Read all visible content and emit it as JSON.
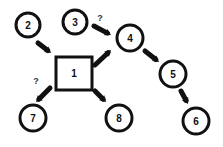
{
  "diagram": {
    "colors": {
      "stroke": "#111111",
      "background": "#ffffff"
    },
    "nodes": [
      {
        "id": "1",
        "label": "1",
        "shape": "square",
        "x": 56,
        "y": 57,
        "w": 36,
        "h": 33
      },
      {
        "id": "2",
        "label": "2",
        "shape": "circle",
        "cx": 28,
        "cy": 25,
        "r": 12
      },
      {
        "id": "3",
        "label": "3",
        "shape": "circle",
        "cx": 75,
        "cy": 22,
        "r": 12
      },
      {
        "id": "4",
        "label": "4",
        "shape": "circle",
        "cx": 130,
        "cy": 38,
        "r": 13
      },
      {
        "id": "5",
        "label": "5",
        "shape": "circle",
        "cx": 173,
        "cy": 74,
        "r": 13
      },
      {
        "id": "6",
        "label": "6",
        "shape": "circle",
        "cx": 196,
        "cy": 121,
        "r": 13
      },
      {
        "id": "7",
        "label": "7",
        "shape": "circle",
        "cx": 33,
        "cy": 118,
        "r": 13
      },
      {
        "id": "8",
        "label": "8",
        "shape": "circle",
        "cx": 119,
        "cy": 118,
        "r": 13
      }
    ],
    "edges": [
      {
        "from": "2",
        "to": "1",
        "x1": 38,
        "y1": 43,
        "x2": 51,
        "y2": 53,
        "label": ""
      },
      {
        "from": "3",
        "to": "4",
        "x1": 94,
        "y1": 26,
        "x2": 111,
        "y2": 35,
        "label": "?",
        "lx": 100,
        "ly": 21
      },
      {
        "from": "1",
        "to": "4",
        "x1": 95,
        "y1": 65,
        "x2": 111,
        "y2": 50,
        "label": ""
      },
      {
        "from": "4",
        "to": "5",
        "x1": 145,
        "y1": 51,
        "x2": 159,
        "y2": 62,
        "label": ""
      },
      {
        "from": "5",
        "to": "6",
        "x1": 181,
        "y1": 91,
        "x2": 188,
        "y2": 104,
        "label": ""
      },
      {
        "from": "1",
        "to": "7",
        "x1": 50,
        "y1": 88,
        "x2": 36,
        "y2": 102,
        "label": "?",
        "lx": 36,
        "ly": 84
      },
      {
        "from": "1",
        "to": "8",
        "x1": 95,
        "y1": 91,
        "x2": 106,
        "y2": 102,
        "label": ""
      }
    ]
  }
}
